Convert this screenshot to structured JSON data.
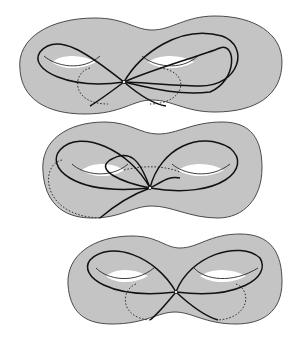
{
  "figure": {
    "colors": {
      "surface_fill": "#c4c4c4",
      "curve": "#111111",
      "background": "#ffffff"
    },
    "panels": [
      {
        "id": "top",
        "label": ""
      },
      {
        "id": "middle",
        "label": ""
      },
      {
        "id": "bottom",
        "label": ""
      }
    ]
  }
}
